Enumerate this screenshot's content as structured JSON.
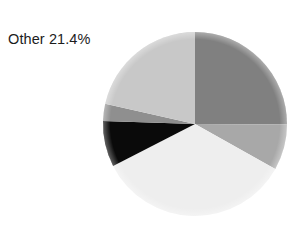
{
  "chart_data": {
    "type": "pie",
    "title": "",
    "xlabel": "",
    "ylabel": "",
    "legend_position": "none",
    "grid": false,
    "start_angle_deg": 0,
    "direction": "clockwise",
    "center": {
      "x": 195,
      "y": 124
    },
    "radius": 92,
    "labels": [
      "Segment 1",
      "Segment 2",
      "Segment 3",
      "Segment 4",
      "Segment 5",
      "Other"
    ],
    "values": [
      25.0,
      8.0,
      34.2,
      8.0,
      3.0,
      21.4
    ],
    "colors": [
      "#808080",
      "#a8a8a8",
      "#eeeeee",
      "#0a0a0a",
      "#8f8f8f",
      "#c8c8c8"
    ],
    "annotations": [
      {
        "name": "other-slice-label",
        "text": "Other 21.4%",
        "target_slice": "Other",
        "value": 21.4,
        "unit": "%"
      }
    ]
  },
  "label": {
    "other_text": "Other 21.4%"
  },
  "colors": {
    "background": "#ffffff",
    "text": "#1c1c1c",
    "slice_dark_gray": "#808080",
    "slice_medium_gray": "#a8a8a8",
    "slice_very_light": "#eeeeee",
    "slice_black": "#0a0a0a",
    "slice_mid_dark_gray": "#8f8f8f",
    "slice_light_gray": "#c8c8c8"
  }
}
